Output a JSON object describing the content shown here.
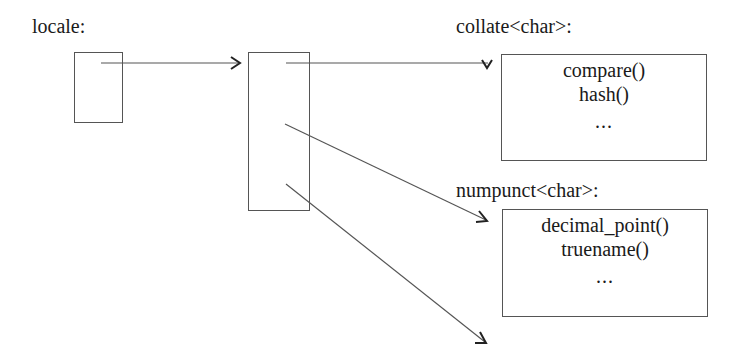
{
  "diagram": {
    "locale_label": "locale:",
    "facets": [
      {
        "name": "collate<char>:",
        "members": [
          "compare()",
          "hash()"
        ],
        "more": "..."
      },
      {
        "name": "numpunct<char>:",
        "members": [
          "decimal_point()",
          "truename()"
        ],
        "more": "..."
      }
    ],
    "colors": {
      "line": "#555555",
      "text": "#1a1a1a",
      "background": "#ffffff"
    }
  }
}
